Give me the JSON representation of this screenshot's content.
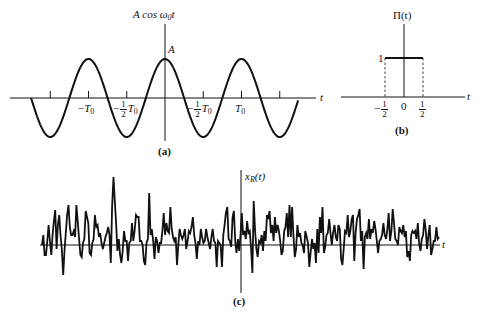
{
  "figure": {
    "panel_a": {
      "caption": "(a)",
      "y_label": {
        "prefix": "A cos ω",
        "sub": "0",
        "suffix": "t"
      },
      "amplitude_label": "A",
      "x_label": "t",
      "ticks": [
        {
          "minus": "−",
          "frac": false,
          "sym": "T",
          "sub": "0",
          "pos": "-T0"
        },
        {
          "minus": "−",
          "frac": true,
          "num": "1",
          "den": "2",
          "sym": "T",
          "sub": "0",
          "pos": "-T0/2"
        },
        {
          "minus": "−",
          "frac": true,
          "num": "1",
          "den": "2",
          "sym": "T",
          "sub": "0",
          "pos": "T0/2 (as printed)"
        },
        {
          "minus": "",
          "frac": false,
          "sym": "T",
          "sub": "0",
          "pos": "T0"
        }
      ]
    },
    "panel_b": {
      "caption": "(b)",
      "y_label": "Π(t)",
      "height_label": "1",
      "x_label": "t",
      "ticks": {
        "left": {
          "minus": "−",
          "num": "1",
          "den": "2"
        },
        "center": "0",
        "right": {
          "num": "1",
          "den": "2"
        }
      }
    },
    "panel_c": {
      "caption": "(c)",
      "y_label": {
        "prefix": "x",
        "sub": "R",
        "suffix": "(t)"
      },
      "x_label": "t"
    }
  },
  "chart_data": [
    {
      "type": "line",
      "title": "A cos ω0 t",
      "xlabel": "t",
      "ylabel": "A cos ω0t",
      "function": "A*cos(2*pi*t/T0)",
      "x_range_periods": [
        -1.75,
        1.75
      ],
      "tick_labels": [
        "−T0",
        "−½T0",
        "−½T0",
        "T0"
      ],
      "annotations": [
        "A"
      ]
    },
    {
      "type": "line",
      "title": "Π(t)",
      "xlabel": "t",
      "x": [
        -0.5,
        -0.5,
        0.5,
        0.5
      ],
      "values": [
        0,
        1,
        1,
        0
      ],
      "tick_labels": [
        "−1/2",
        "0",
        "1/2"
      ],
      "ylabel_ticks": [
        "1"
      ],
      "dashed_edges": true
    },
    {
      "type": "line",
      "title": "x_R(t)",
      "xlabel": "t",
      "description": "random noise waveform",
      "x_start_px": 42,
      "x_step_px": 3.0,
      "offsets_px": [
        0,
        -10,
        10,
        10,
        -4,
        -20,
        -4,
        10,
        -10,
        -24,
        -35,
        4,
        -20,
        -30,
        -10,
        4,
        30,
        6,
        -12,
        -30,
        -40,
        -18,
        -10,
        -10,
        -14,
        -8,
        -40,
        -24,
        -6,
        10,
        12,
        -2,
        -6,
        -34,
        -28,
        -22,
        8,
        10,
        -2,
        -6,
        -30,
        -18,
        -20,
        -8,
        -12,
        -2,
        4,
        -2,
        -8,
        -12,
        -18,
        -10,
        18,
        -38,
        -68,
        -44,
        -22,
        6,
        -6,
        10,
        18,
        6,
        -14,
        -4,
        -4,
        16,
        -2,
        -4,
        -22,
        -4,
        -14,
        -30,
        -28,
        -28,
        -4,
        -4,
        0,
        16,
        20,
        -2,
        -6,
        -52,
        -10,
        -16,
        -4,
        14,
        -8,
        -4,
        8,
        -2,
        -2,
        -14,
        -32,
        -10,
        -22,
        -14,
        -12,
        -38,
        -16,
        -8,
        -4,
        -8,
        20,
        0,
        -16,
        -10,
        -6,
        -10,
        -16,
        4,
        -4,
        -14,
        -12,
        -18,
        -28,
        -10,
        -2,
        14,
        -4,
        0,
        -16,
        -8,
        -2,
        -4,
        -16,
        -8,
        -2,
        4,
        -8,
        -16,
        -4,
        -2,
        22,
        -4,
        -2,
        0,
        22,
        -10,
        -20,
        -32,
        -38,
        -6,
        -4,
        2,
        -28,
        -34,
        -4,
        8,
        -6,
        6,
        -10,
        -32,
        -10,
        -14,
        -6,
        -24,
        -12,
        -14,
        4,
        28,
        -44,
        -14,
        4,
        12,
        -4,
        -2,
        -10,
        6,
        -14,
        -4,
        -30,
        -26,
        -34,
        -12,
        -20,
        -4,
        -28,
        -12,
        -20,
        -14,
        -4,
        10,
        6,
        -14,
        -18,
        -32,
        -8,
        -40,
        -8,
        -38,
        -10,
        12,
        4,
        -20,
        -8,
        -12,
        -2,
        0,
        8,
        -14,
        -8,
        -2,
        22,
        8,
        -6,
        4,
        -2,
        18,
        -16,
        8,
        -28,
        -12,
        -38,
        8,
        2,
        -10,
        -12,
        -26,
        -12,
        0,
        -12,
        -20,
        -8,
        -4,
        -20,
        -16,
        14,
        20,
        4,
        -14,
        -12,
        -30,
        -8,
        -14,
        -26,
        -30,
        16,
        -12,
        -26,
        -30,
        -36,
        -4,
        -14,
        24,
        -8,
        -12,
        -6,
        -26,
        -6,
        -16,
        -12,
        -24,
        -16,
        -4,
        8,
        -4,
        -6,
        -10,
        -22,
        -10,
        -6,
        -16,
        -32,
        -4,
        -14,
        -36,
        -22,
        -6,
        -4,
        0,
        -18,
        -14,
        -12,
        -20,
        -8,
        -14,
        12,
        6,
        16,
        -10,
        -14,
        -12,
        -14,
        -6,
        -22,
        -2,
        6,
        -6,
        -10,
        -26,
        -14,
        4,
        -10,
        -20,
        10,
        4,
        -4,
        -4,
        -18,
        -6,
        -8
      ]
    }
  ]
}
